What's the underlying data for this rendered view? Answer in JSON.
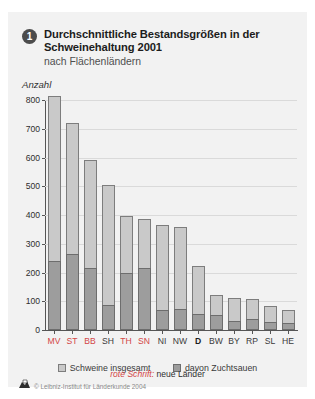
{
  "header": {
    "badge_number": "1",
    "title_line1": "Durchschnittliche Bestandsgrößen in der",
    "title_line2": "Schweinehaltung 2001",
    "subtitle": "nach Flächenländern"
  },
  "footer": {
    "copyright": "© Leibniz-Institut für Länderkunde 2004",
    "logo_icon": "ifl-logo-icon"
  },
  "legend": {
    "items": [
      {
        "label": "Schweine insgesamt",
        "color": "#c9c9c9",
        "swatch_icon": "legend-swatch-total"
      },
      {
        "label": "davon Zuchtsauen",
        "color": "#9d9d9d",
        "swatch_icon": "legend-swatch-sows"
      }
    ],
    "note_red": "rote Schrift:",
    "note_black": "neue Länder"
  },
  "chart_data": {
    "type": "bar",
    "title": "Durchschnittliche Bestandsgrößen in der Schweinehaltung 2001",
    "subtitle": "nach Flächenländern",
    "xlabel": "",
    "ylabel": "Anzahl",
    "ylim": [
      0,
      800
    ],
    "yticks": [
      0,
      100,
      200,
      300,
      400,
      500,
      600,
      700,
      800
    ],
    "grid": true,
    "legend_position": "bottom",
    "categories": [
      "MV",
      "ST",
      "BB",
      "SH",
      "TH",
      "SN",
      "NI",
      "NW",
      "D",
      "BW",
      "BY",
      "RP",
      "SL",
      "HE"
    ],
    "category_types": [
      "east",
      "east",
      "east",
      "west",
      "east",
      "east",
      "west",
      "west",
      "de",
      "west",
      "west",
      "west",
      "west",
      "west"
    ],
    "series": [
      {
        "name": "Schweine insgesamt",
        "color": "#c9c9c9",
        "values": [
          815,
          720,
          590,
          505,
          397,
          385,
          367,
          357,
          222,
          121,
          112,
          109,
          84,
          68
        ]
      },
      {
        "name": "davon Zuchtsauen",
        "color": "#9d9d9d",
        "values": [
          241,
          263,
          214,
          88,
          200,
          214,
          68,
          72,
          57,
          51,
          31,
          37,
          29,
          25
        ]
      }
    ]
  }
}
